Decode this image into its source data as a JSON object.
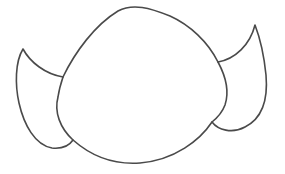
{
  "drawing": {
    "subject": "line drawing of a rounded head with two pointed ears",
    "stroke_color": "#4a4a4a",
    "background_color": "#ffffff",
    "stroke_width": 1.6,
    "parts": [
      "head",
      "left-ear",
      "right-ear"
    ]
  }
}
